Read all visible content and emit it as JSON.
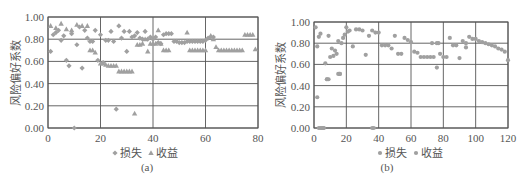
{
  "colors": {
    "marker": "#a0a0a0",
    "grid": "#555555",
    "axis": "#555555",
    "text": "#555555"
  },
  "chart_data": [
    {
      "type": "scatter",
      "panel_label": "(a)",
      "title": "",
      "xlabel": "",
      "ylabel": "风险偏好系数",
      "xlim": [
        0,
        80
      ],
      "ylim": [
        0,
        1
      ],
      "xticks": [
        "0",
        "20",
        "40",
        "60",
        "80"
      ],
      "yticks": [
        "0.00",
        "0.20",
        "0.40",
        "0.60",
        "0.80",
        "1.00"
      ],
      "grid": true,
      "legend": {
        "position": "bottom",
        "entries": [
          {
            "name": "损失",
            "marker": "diamond"
          },
          {
            "name": "收益",
            "marker": "triangle"
          }
        ]
      },
      "series": [
        {
          "name": "损失",
          "marker": "diamond",
          "x": [
            1,
            2,
            3,
            4,
            5,
            6,
            7,
            8,
            9,
            10,
            11,
            12,
            13,
            14,
            15,
            16,
            17,
            18,
            19,
            20,
            21,
            22,
            23,
            24,
            25,
            26,
            27,
            28,
            29,
            30,
            31,
            32,
            33,
            34,
            35,
            36,
            37,
            38,
            39,
            40,
            41,
            42,
            43,
            44,
            45,
            46,
            47,
            48,
            49,
            50,
            51,
            52,
            53,
            54,
            55,
            56,
            57,
            58,
            59,
            60,
            61,
            62,
            63
          ],
          "y": [
            0.69,
            0.84,
            0.86,
            0.88,
            0.79,
            0.83,
            0.61,
            0.56,
            0.85,
            0.0,
            0.75,
            0.91,
            0.54,
            0.88,
            0.81,
            0.78,
            0.78,
            0.88,
            0.61,
            0.84,
            0.59,
            0.79,
            0.79,
            0.87,
            0.78,
            0.17,
            0.92,
            0.81,
            0.87,
            0.69,
            0.87,
            0.82,
            0.83,
            0.86,
            0.81,
            0.8,
            0.87,
            0.8,
            0.82,
            0.8,
            0.82,
            0.77,
            0.76,
            0.84,
            0.85,
            0.85,
            0.85,
            0.78,
            0.78,
            0.77,
            0.77,
            0.77,
            0.78,
            0.78,
            0.78,
            0.78,
            0.78,
            0.78,
            0.78,
            0.79,
            0.81,
            0.82,
            0.82
          ]
        },
        {
          "name": "收益",
          "marker": "triangle",
          "x": [
            1,
            3,
            5,
            7,
            9,
            11,
            13,
            15,
            16,
            17,
            18,
            20,
            21,
            22,
            23,
            24,
            25,
            26,
            27,
            28,
            29,
            30,
            31,
            32,
            33,
            34,
            35,
            36,
            37,
            38,
            39,
            40,
            41,
            42,
            43,
            44,
            45,
            46,
            53,
            54,
            55,
            56,
            57,
            58,
            59,
            60,
            62,
            63,
            64,
            65,
            66,
            67,
            68,
            69,
            70,
            71,
            72,
            73,
            74,
            75,
            76,
            77,
            78,
            79
          ],
          "y": [
            0.92,
            0.9,
            0.94,
            0.89,
            0.88,
            0.93,
            0.92,
            0.92,
            0.7,
            0.7,
            0.68,
            0.58,
            0.58,
            0.57,
            0.56,
            0.56,
            0.56,
            0.56,
            0.51,
            0.51,
            0.51,
            0.51,
            0.51,
            0.51,
            0.13,
            0.75,
            0.75,
            0.76,
            0.8,
            0.69,
            0.76,
            0.76,
            0.76,
            0.88,
            0.76,
            0.7,
            0.7,
            0.7,
            0.86,
            0.7,
            0.7,
            0.7,
            0.7,
            0.7,
            0.7,
            0.7,
            0.83,
            0.8,
            0.73,
            0.7,
            0.7,
            0.7,
            0.7,
            0.7,
            0.7,
            0.7,
            0.7,
            0.7,
            0.7,
            0.84,
            0.84,
            0.84,
            0.84,
            0.71
          ]
        }
      ]
    },
    {
      "type": "scatter",
      "panel_label": "(b)",
      "title": "",
      "xlabel": "",
      "ylabel": "风险偏好系数",
      "xlim": [
        0,
        120
      ],
      "ylim": [
        0,
        1
      ],
      "xticks": [
        "0",
        "20",
        "40",
        "60",
        "80",
        "100",
        "120"
      ],
      "yticks": [
        "0.00",
        "0.20",
        "0.40",
        "0.60",
        "0.80",
        "1.00"
      ],
      "grid": true,
      "legend": {
        "position": "bottom",
        "entries": [
          {
            "name": "损失",
            "marker": "circle"
          },
          {
            "name": "收益",
            "marker": "circle"
          }
        ]
      },
      "series": [
        {
          "name": "损失",
          "marker": "circle",
          "x": [
            1,
            2,
            3,
            4,
            5,
            6,
            7,
            8,
            9,
            10,
            11,
            12,
            13,
            14,
            15,
            16,
            17,
            18,
            19,
            20,
            21,
            22,
            24,
            26,
            28,
            30,
            32,
            34,
            36,
            38,
            40,
            42,
            44,
            46,
            48,
            50,
            52,
            54,
            56,
            58,
            60,
            62,
            64,
            66,
            68,
            70,
            72,
            74,
            76,
            78,
            80,
            82,
            84,
            86,
            88,
            90,
            92,
            94,
            96,
            98,
            100,
            102,
            104,
            106,
            108,
            110,
            112,
            114,
            116,
            118,
            120
          ],
          "y": [
            0.95,
            0.29,
            0.86,
            0.89,
            0.0,
            0.0,
            0.61,
            0.46,
            0.87,
            0.67,
            0.75,
            0.68,
            0.73,
            0.7,
            0.82,
            0.51,
            0.8,
            0.85,
            0.88,
            0.95,
            0.91,
            0.92,
            0.77,
            0.93,
            0.93,
            0.92,
            0.69,
            0.87,
            0.92,
            0.9,
            0.9,
            0.78,
            0.78,
            0.78,
            0.75,
            0.87,
            0.7,
            0.7,
            0.85,
            0.83,
            0.81,
            0.72,
            0.71,
            0.67,
            0.67,
            0.67,
            0.67,
            0.67,
            0.57,
            0.7,
            0.67,
            0.67,
            0.85,
            0.78,
            0.78,
            0.66,
            0.82,
            0.76,
            0.86,
            0.84,
            0.84,
            0.82,
            0.81,
            0.8,
            0.79,
            0.78,
            0.77,
            0.75,
            0.74,
            0.72,
            0.64
          ]
        },
        {
          "name": "收益",
          "marker": "circle",
          "x": [
            2,
            3,
            4,
            5,
            6,
            8,
            9,
            15,
            16,
            36,
            37,
            73,
            76,
            77,
            94
          ],
          "y": [
            0.77,
            0.0,
            0.0,
            0.0,
            0.0,
            0.46,
            0.46,
            0.51,
            0.51,
            0.0,
            0.0,
            0.8,
            0.8,
            0.8,
            0.8
          ]
        }
      ]
    }
  ]
}
